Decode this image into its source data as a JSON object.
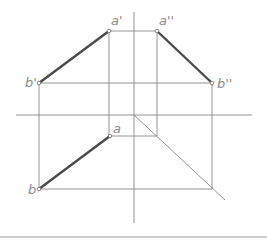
{
  "diagram": {
    "type": "orthographic-projection-of-line-segment",
    "labels": {
      "a_front": "a'",
      "a_side": "a''",
      "b_front": "b'",
      "b_side": "b''",
      "a_top": "a",
      "b_top": "b"
    },
    "points": {
      "a_front": [
        109,
        31
      ],
      "a_side": [
        157,
        31
      ],
      "b_front": [
        39,
        83
      ],
      "b_side": [
        212,
        83
      ],
      "a_top": [
        110,
        136
      ],
      "b_top": [
        39,
        189
      ]
    },
    "axes": {
      "horizontal": {
        "y": 115,
        "x1": 16,
        "x2": 252
      },
      "vertical": {
        "x": 134,
        "y1": 12,
        "y2": 223
      },
      "diagonal_45": {
        "x1": 134,
        "y1": 115,
        "x2": 225,
        "y2": 200
      }
    },
    "colors": {
      "thin_line": "#7a7a7a",
      "thick_line": "#4a4a4a",
      "label": "#8a8a8a"
    }
  }
}
